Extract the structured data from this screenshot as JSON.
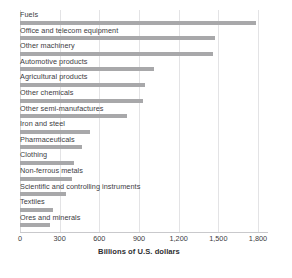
{
  "chart_data": {
    "type": "bar",
    "orientation": "horizontal",
    "title": "",
    "subtitle": "",
    "xlabel": "Billions of U.S. dollars",
    "ylabel": "",
    "xlim": [
      0,
      1800
    ],
    "xticks": [
      0,
      300,
      600,
      900,
      1200,
      1500,
      1800
    ],
    "xtick_labels": [
      "0",
      "300",
      "600",
      "900",
      "1,200",
      "1,500",
      "1,800"
    ],
    "grid": true,
    "grid_axis": "x",
    "legend": false,
    "bar_color": "#a8a8aa",
    "background_color": "#ffffff",
    "text_color": "#3c3c3f",
    "categories": [
      "Fuels",
      "Office and telecom equipment",
      "Other machinery",
      "Automotive products",
      "Agricultural products",
      "Other chemicals",
      "Other semi-manufactures",
      "Iron and steel",
      "Pharmaceuticals",
      "Clothing",
      "Non-ferrous metals",
      "Scientific and controlling instruments",
      "Textiles",
      "Ores and minerals"
    ],
    "values": [
      1785,
      1475,
      1460,
      1010,
      945,
      930,
      810,
      530,
      470,
      410,
      390,
      350,
      250,
      230
    ]
  }
}
